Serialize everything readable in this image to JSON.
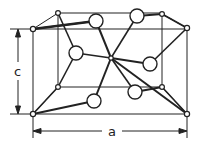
{
  "diagram": {
    "labels": {
      "c": "c",
      "a": "a"
    },
    "colors": {
      "line": "#222222",
      "atom_fill": "#ffffff",
      "background": "#ffffff"
    },
    "cell": {
      "front": {
        "x1": 33,
        "y1": 29,
        "x2": 187,
        "y2": 114
      },
      "back": {
        "x1": 58,
        "y1": 13,
        "x2": 162,
        "y2": 87
      }
    },
    "small_atoms": [
      {
        "id": "ftl",
        "x": 33,
        "y": 29
      },
      {
        "id": "btl",
        "x": 58,
        "y": 13
      },
      {
        "id": "btr",
        "x": 162,
        "y": 14
      },
      {
        "id": "ftr",
        "x": 187,
        "y": 28
      },
      {
        "id": "fbl",
        "x": 33,
        "y": 114
      },
      {
        "id": "bbl",
        "x": 58,
        "y": 87
      },
      {
        "id": "bbr",
        "x": 162,
        "y": 87
      },
      {
        "id": "fbr",
        "x": 187,
        "y": 114
      },
      {
        "id": "center",
        "x": 111,
        "y": 58
      }
    ],
    "large_atoms": [
      {
        "id": "L1",
        "x": 96,
        "y": 21
      },
      {
        "id": "L2",
        "x": 137,
        "y": 16
      },
      {
        "id": "L3",
        "x": 76,
        "y": 53
      },
      {
        "id": "L4",
        "x": 150,
        "y": 64
      },
      {
        "id": "L5",
        "x": 135,
        "y": 92
      },
      {
        "id": "L6",
        "x": 94,
        "y": 101
      }
    ]
  }
}
